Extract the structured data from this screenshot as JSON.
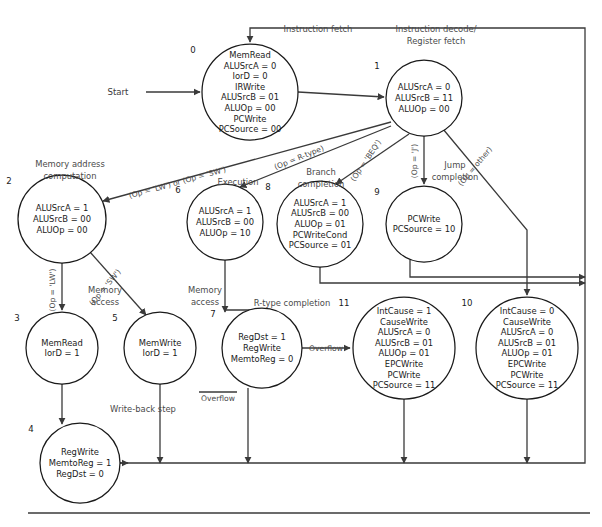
{
  "figure": {
    "start_label": "Start",
    "overflow_label": "Overflow",
    "overflow_bar_label": "Overflow"
  },
  "captions": {
    "instruction_fetch": "Instruction fetch",
    "instruction_decode_l1": "Instruction decode/",
    "instruction_decode_l2": "Register fetch",
    "memory_address_l1": "Memory address",
    "memory_address_l2": "computation",
    "execution": "Execution",
    "branch_l1": "Branch",
    "branch_l2": "completion",
    "jump_l1": "Jump",
    "jump_l2": "completion",
    "memory_access_lw_l1": "Memory",
    "memory_access_lw_l2": "access",
    "memory_access_sw_l1": "Memory",
    "memory_access_sw_l2": "access",
    "rtype_completion": "R-type completion",
    "write_back_step": "Write-back step"
  },
  "edge_labels": {
    "lw_or_sw": "(Op = 'LW') or (Op = 'SW')",
    "rtype": "(Op = R-type)",
    "beq": "(Op = 'BEQ')",
    "jump": "(Op = 'J')",
    "other": "(Op = other)",
    "lw": "(Op = 'LW')",
    "sw": "(Op = 'SW')"
  },
  "states": [
    {
      "id": "0",
      "cx": 250,
      "cy": 92,
      "r": 48,
      "lines": [
        "MemRead",
        "ALUSrcA = 0",
        "IorD = 0",
        "IRWrite",
        "ALUSrcB = 01",
        "ALUOp = 00",
        "PCWrite",
        "PCSource = 00"
      ]
    },
    {
      "id": "1",
      "cx": 424,
      "cy": 98,
      "r": 38,
      "lines": [
        "ALUSrcA = 0",
        "ALUSrcB = 11",
        "ALUOp = 00"
      ]
    },
    {
      "id": "2",
      "cx": 62,
      "cy": 219,
      "r": 44,
      "lines": [
        "ALUSrcA = 1",
        "ALUSrcB = 00",
        "ALUOp = 00"
      ]
    },
    {
      "id": "6",
      "cx": 225,
      "cy": 222,
      "r": 38,
      "lines": [
        "ALUSrcA = 1",
        "ALUSrcB = 00",
        "ALUOp = 10"
      ]
    },
    {
      "id": "8",
      "cx": 320,
      "cy": 224,
      "r": 43,
      "lines": [
        "ALUSrcA = 1",
        "ALUSrcB = 00",
        "ALUOp = 01",
        "PCWriteCond",
        "PCSource = 01"
      ]
    },
    {
      "id": "9",
      "cx": 424,
      "cy": 224,
      "r": 38,
      "lines": [
        "PCWrite",
        "PCSource = 10"
      ]
    },
    {
      "id": "3",
      "cx": 62,
      "cy": 348,
      "r": 36,
      "lines": [
        "MemRead",
        "IorD = 1"
      ]
    },
    {
      "id": "5",
      "cx": 160,
      "cy": 348,
      "r": 36,
      "lines": [
        "MemWrite",
        "IorD = 1"
      ]
    },
    {
      "id": "7",
      "cx": 262,
      "cy": 348,
      "r": 40,
      "lines": [
        "RegDst = 1",
        "RegWrite",
        "MemtoReg = 0"
      ]
    },
    {
      "id": "11",
      "cx": 404,
      "cy": 348,
      "r": 51,
      "lines": [
        "IntCause = 1",
        "CauseWrite",
        "ALUSrcA = 0",
        "ALUSrcB = 01",
        "ALUOp = 01",
        "EPCWrite",
        "PCWrite",
        "PCSource = 11"
      ]
    },
    {
      "id": "10",
      "cx": 527,
      "cy": 348,
      "r": 51,
      "lines": [
        "IntCause = 0",
        "CauseWrite",
        "ALUSrcA = 0",
        "ALUSrcB = 01",
        "ALUOp = 01",
        "EPCWrite",
        "PCWrite",
        "PCSource = 11"
      ]
    },
    {
      "id": "4",
      "cx": 80,
      "cy": 463,
      "r": 40,
      "lines": [
        "RegWrite",
        "MemtoReg = 1",
        "RegDst = 0"
      ]
    }
  ],
  "colors": {
    "stroke": "#3a3a3a",
    "node_stroke": "#1a1a1a",
    "text": "#1a1a1a",
    "caption_text": "#4a4a4a",
    "background": "#ffffff"
  }
}
